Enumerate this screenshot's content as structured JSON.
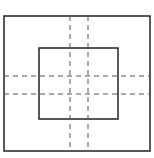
{
  "diagram": {
    "type": "nested-rectangles-with-dashed-guides",
    "canvas": {
      "width": 154,
      "height": 158,
      "background": "#ffffff"
    },
    "outer_rect": {
      "x": 4,
      "y": 16,
      "width": 146,
      "height": 135,
      "stroke": "#222222",
      "stroke_width": 1.5
    },
    "inner_rect": {
      "x": 39,
      "y": 48,
      "width": 79,
      "height": 71,
      "stroke": "#222222",
      "stroke_width": 1.5
    },
    "dashed_lines": {
      "stroke": "#555555",
      "stroke_width": 1,
      "dash": "5 4",
      "vertical": [
        {
          "x": 70,
          "y1": 16,
          "y2": 151
        },
        {
          "x": 88,
          "y1": 16,
          "y2": 151
        }
      ],
      "horizontal": [
        {
          "y": 76,
          "x1": 4,
          "x2": 150
        },
        {
          "y": 94,
          "x1": 4,
          "x2": 150
        }
      ]
    }
  }
}
